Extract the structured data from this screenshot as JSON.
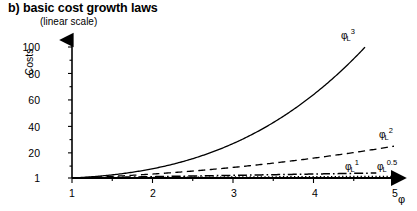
{
  "chart_data": {
    "type": "line",
    "title": "b) basic cost growth laws",
    "subtitle": "(linear scale)",
    "xlabel": "φ",
    "ylabel": "Costs",
    "xlim": [
      1,
      5
    ],
    "ylim": [
      1,
      110
    ],
    "grid": false,
    "legend_position": "inline-end-of-curve",
    "scale": "linear",
    "xticks": [
      "1",
      "2",
      "3",
      "4",
      "5"
    ],
    "xtick_values": [
      1,
      2,
      3,
      4,
      5
    ],
    "yticks": [
      "1",
      "20",
      "40",
      "60",
      "80",
      "100"
    ],
    "ytick_values": [
      1,
      20,
      40,
      60,
      80,
      100
    ],
    "x": [
      1.0,
      1.2,
      1.4,
      1.6,
      1.8,
      2.0,
      2.2,
      2.4,
      2.6,
      2.8,
      3.0,
      3.2,
      3.4,
      3.6,
      3.8,
      4.0,
      4.2,
      4.4,
      4.6,
      4.8,
      5.0
    ],
    "series": [
      {
        "name": "φ_L^3",
        "label_base": "φ",
        "label_sub": "L",
        "label_sup": "3",
        "style": "solid",
        "exponent": 3,
        "x_end": 4.64,
        "values": [
          1.0,
          1.73,
          2.74,
          4.1,
          5.83,
          8.0,
          10.65,
          13.82,
          17.58,
          21.95,
          27.0,
          32.77,
          39.3,
          46.66,
          54.87,
          64.0,
          74.09,
          85.18,
          97.34,
          110.59,
          125.0
        ]
      },
      {
        "name": "φ_L^2",
        "label_base": "φ",
        "label_sub": "L",
        "label_sup": "2",
        "style": "dashed",
        "exponent": 2,
        "x_end": 5.0,
        "values": [
          1.0,
          1.44,
          1.96,
          2.56,
          3.24,
          4.0,
          4.84,
          5.76,
          6.76,
          7.84,
          9.0,
          10.24,
          11.56,
          12.96,
          14.44,
          16.0,
          17.64,
          19.36,
          21.16,
          23.04,
          25.0
        ]
      },
      {
        "name": "φ_L^1",
        "label_base": "φ",
        "label_sub": "L",
        "label_sup": "1",
        "style": "dash-dot",
        "exponent": 1,
        "x_end": 4.78,
        "values": [
          1.0,
          1.2,
          1.4,
          1.6,
          1.8,
          2.0,
          2.2,
          2.4,
          2.6,
          2.8,
          3.0,
          3.2,
          3.4,
          3.6,
          3.8,
          4.0,
          4.2,
          4.4,
          4.6,
          4.8,
          5.0
        ]
      },
      {
        "name": "φ_L^0.5",
        "label_base": "φ",
        "label_sub": "L",
        "label_sup": "0.5",
        "style": "dotted",
        "exponent": 0.5,
        "x_end": 5.0,
        "values": [
          1.0,
          1.095,
          1.183,
          1.265,
          1.342,
          1.414,
          1.483,
          1.549,
          1.612,
          1.673,
          1.732,
          1.789,
          1.844,
          1.897,
          1.949,
          2.0,
          2.049,
          2.098,
          2.145,
          2.191,
          2.236
        ]
      }
    ],
    "colors": {
      "axis": "#000000",
      "curve": "#000000",
      "background": "#ffffff"
    }
  }
}
